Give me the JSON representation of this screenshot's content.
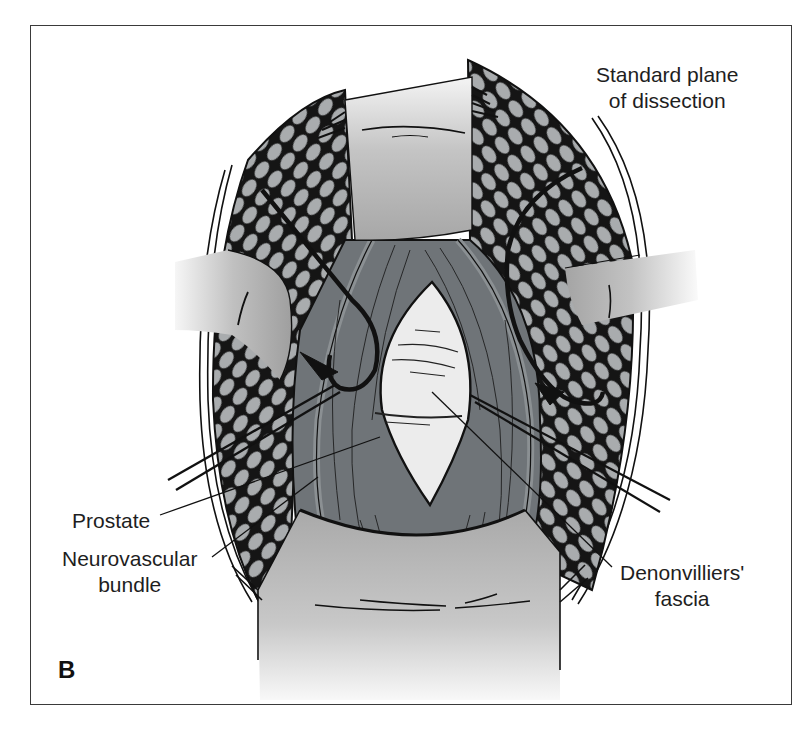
{
  "figure": {
    "panel_letter": "B",
    "labels": {
      "standard_plane": {
        "line1": "Standard plane",
        "line2": "of dissection"
      },
      "prostate": {
        "line1": "Prostate"
      },
      "neurovascular_bundle": {
        "line1": "Neurovascular",
        "line2": "bundle"
      },
      "denonvilliers_fascia": {
        "line1": "Denonvilliers'",
        "line2": "fascia"
      }
    },
    "colors": {
      "frame": "#3a3a3a",
      "retractor": "#b9b9b9",
      "fat_lobules": "#a9acae",
      "fat_outline": "#151515",
      "muscle": "#6f7478",
      "muscle_light": "#8b9093",
      "prostate": "#ececec",
      "ink": "#111111"
    }
  }
}
